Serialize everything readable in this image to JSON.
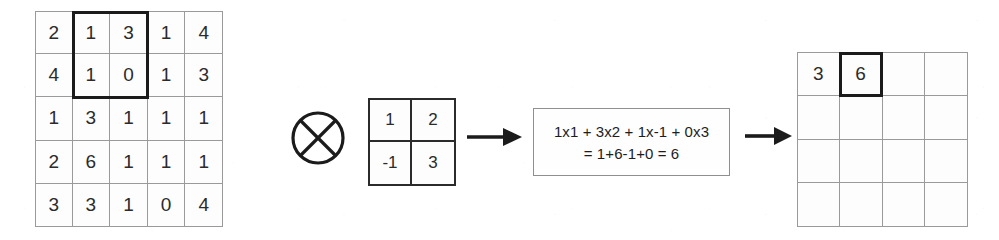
{
  "diagram": {
    "operator_symbol": "circled-times",
    "colors": {
      "grid_line": "#9a9a9a",
      "kernel_line": "#2b2b2b",
      "highlight": "#1b1b1b",
      "text": "#2b2b2b",
      "background": "#ffffff"
    }
  },
  "input_matrix": {
    "label": "input-matrix",
    "rows": 5,
    "cols": 5,
    "values": [
      [
        "2",
        "1",
        "3",
        "1",
        "4"
      ],
      [
        "4",
        "1",
        "0",
        "1",
        "3"
      ],
      [
        "1",
        "3",
        "1",
        "1",
        "1"
      ],
      [
        "2",
        "6",
        "1",
        "1",
        "1"
      ],
      [
        "3",
        "3",
        "1",
        "0",
        "4"
      ]
    ],
    "highlight": {
      "start_row": 0,
      "start_col": 1,
      "row_span": 2,
      "col_span": 2
    }
  },
  "kernel_matrix": {
    "label": "kernel-matrix",
    "rows": 2,
    "cols": 2,
    "values": [
      [
        "1",
        "2"
      ],
      [
        "-1",
        "3"
      ]
    ]
  },
  "formula": {
    "line1": "1x1 + 3x2 + 1x-1 + 0x3",
    "line2": "= 1+6-1+0 = 6",
    "result": "6"
  },
  "output_matrix": {
    "label": "output-matrix",
    "rows": 4,
    "cols": 4,
    "values": [
      [
        "3",
        "6",
        "",
        ""
      ],
      [
        "",
        "",
        "",
        ""
      ],
      [
        "",
        "",
        "",
        ""
      ],
      [
        "",
        "",
        "",
        ""
      ]
    ],
    "highlight": {
      "start_row": 0,
      "start_col": 1,
      "row_span": 1,
      "col_span": 1
    }
  },
  "arrows": {
    "kernel_to_formula": "arrow-right",
    "formula_to_output": "arrow-right"
  }
}
